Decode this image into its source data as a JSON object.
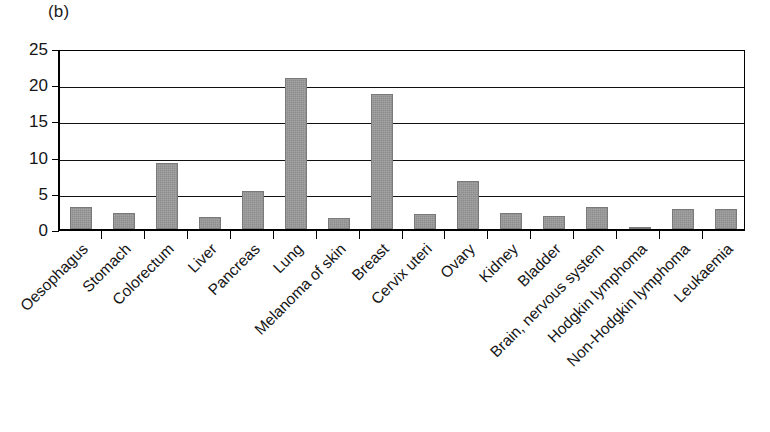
{
  "figure": {
    "panel_label": "(b)",
    "bar_color": "#8d8d8d",
    "axis_color": "#000000",
    "background": "#ffffff"
  },
  "chart_data": {
    "type": "bar",
    "title": "(b)",
    "xlabel": "",
    "ylabel": "",
    "ylim": [
      0,
      25
    ],
    "yticks": [
      0,
      5,
      10,
      15,
      20,
      25
    ],
    "grid": true,
    "legend": "none",
    "categories": [
      "Oesophagus",
      "Stomach",
      "Colorectum",
      "Liver",
      "Pancreas",
      "Lung",
      "Melanoma of skin",
      "Breast",
      "Cervix uteri",
      "Ovary",
      "Kidney",
      "Bladder",
      "Brain, nervous system",
      "Hodgkin lymphoma",
      "Non-Hodgkin lymphoma",
      "Leukaemia"
    ],
    "values": [
      3.1,
      2.2,
      9.1,
      1.7,
      5.2,
      20.9,
      1.5,
      18.7,
      2.1,
      6.7,
      2.2,
      1.8,
      3.0,
      0.2,
      2.7,
      2.7
    ]
  }
}
